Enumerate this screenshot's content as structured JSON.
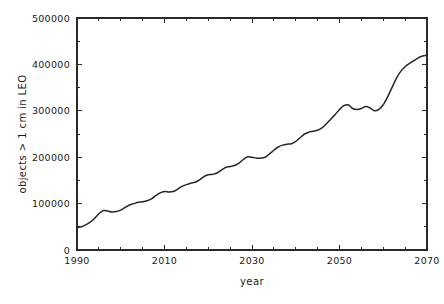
{
  "chart_data": {
    "type": "line",
    "title": "",
    "subtitle": "",
    "xlabel": "year",
    "ylabel": "objects > 1 cm in LEO",
    "xlim": [
      1990,
      2070
    ],
    "ylim": [
      0,
      500000
    ],
    "grid": false,
    "legend": null,
    "annotations": [],
    "xticks": [
      1990,
      2010,
      2030,
      2050,
      2070
    ],
    "xtick_labels": [
      "1990",
      "2010",
      "2030",
      "2050",
      "2070"
    ],
    "xminor_ticks": [
      1995,
      2000,
      2005,
      2015,
      2020,
      2025,
      2035,
      2040,
      2045,
      2055,
      2060,
      2065
    ],
    "yticks": [
      0,
      100000,
      200000,
      300000,
      400000,
      500000
    ],
    "ytick_labels": [
      "0",
      "100000",
      "200000",
      "300000",
      "400000",
      "500000"
    ],
    "yminor_ticks": [
      50000,
      150000,
      250000,
      350000,
      450000
    ],
    "line_color": "#262626",
    "series": [
      {
        "name": "objects > 1 cm in LEO",
        "x": [
          1990,
          1991,
          1992,
          1993,
          1994,
          1995,
          1996,
          1997,
          1998,
          1999,
          2000,
          2001,
          2002,
          2003,
          2004,
          2005,
          2006,
          2007,
          2008,
          2009,
          2010,
          2011,
          2012,
          2013,
          2014,
          2015,
          2016,
          2017,
          2018,
          2019,
          2020,
          2021,
          2022,
          2023,
          2024,
          2025,
          2026,
          2027,
          2028,
          2029,
          2030,
          2031,
          2032,
          2033,
          2034,
          2035,
          2036,
          2037,
          2038,
          2039,
          2040,
          2041,
          2042,
          2043,
          2044,
          2045,
          2046,
          2047,
          2048,
          2049,
          2050,
          2051,
          2052,
          2053,
          2054,
          2055,
          2056,
          2057,
          2058,
          2059,
          2060,
          2061,
          2062,
          2063,
          2064,
          2065,
          2066,
          2067,
          2068,
          2069,
          2070
        ],
        "y": [
          48000,
          50000,
          54000,
          60000,
          68000,
          78000,
          85000,
          84000,
          82000,
          83000,
          86000,
          92000,
          97000,
          100000,
          103000,
          104000,
          106000,
          110000,
          117000,
          123000,
          126000,
          125000,
          126000,
          131000,
          137000,
          141000,
          144000,
          146000,
          151000,
          158000,
          162000,
          163000,
          166000,
          172000,
          178000,
          180000,
          182000,
          187000,
          195000,
          201000,
          200000,
          198000,
          198000,
          200000,
          207000,
          215000,
          222000,
          226000,
          228000,
          229000,
          234000,
          242000,
          250000,
          254000,
          256000,
          258000,
          263000,
          272000,
          282000,
          292000,
          303000,
          311000,
          313000,
          305000,
          303000,
          305000,
          309000,
          306000,
          300000,
          303000,
          313000,
          330000,
          350000,
          370000,
          385000,
          395000,
          402000,
          408000,
          414000,
          418000,
          420000
        ]
      }
    ]
  },
  "plot_geometry": {
    "left": 77,
    "right": 427,
    "top": 18,
    "bottom": 250
  }
}
